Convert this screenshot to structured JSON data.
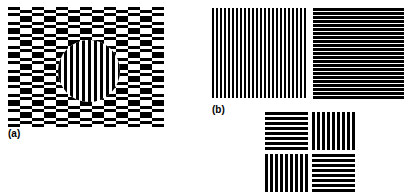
{
  "figure": {
    "background_color": "#ffffff",
    "foreground_color": "#000000",
    "width": 409,
    "height": 193
  },
  "panels": [
    {
      "id": "a",
      "label": "(a)",
      "name": "checkerboard-illusion-panel",
      "description": "Rectangular checkerboard of offset horizontal bar cells with a circular vertical-grating inset at the center",
      "x": 8,
      "y": 7,
      "width": 156,
      "height": 120,
      "pattern": {
        "type": "offset-bar-checkerboard",
        "columns": 13,
        "rows": 10,
        "cell_width": 12,
        "cell_height": 12,
        "bar_height": 3,
        "phase_offset": 3,
        "inset": {
          "type": "circle",
          "pattern": "vertical-grating",
          "center_x": 81,
          "center_y": 64,
          "radius": 31,
          "bar_width": 3
        }
      }
    },
    {
      "id": "b",
      "label": "(b)",
      "name": "paired-grating-panel",
      "description": "Two adjacent squares: left square vertical grating, right square dense horizontal grating",
      "x": 212,
      "y": 8,
      "width": 192,
      "height": 92,
      "squares": [
        {
          "name": "vertical-grating-square",
          "orientation": "vertical",
          "x": 212,
          "y": 8,
          "width": 95,
          "height": 90,
          "period": 4,
          "bar_width": 2,
          "duty_cycle": 0.5,
          "fill_appearance": "balanced black and white"
        },
        {
          "name": "horizontal-grating-square",
          "orientation": "horizontal",
          "x": 313,
          "y": 8,
          "width": 91,
          "height": 92,
          "period": 4,
          "bar_width": 3,
          "duty_cycle": 0.75,
          "fill_appearance": "predominantly black with thin white lines"
        }
      ]
    },
    {
      "id": "c",
      "label": "",
      "name": "quadrant-grating-panel",
      "description": "Two-by-two arrangement of square gratings with alternating orientation",
      "x": 265,
      "y": 112,
      "width": 90,
      "height": 81,
      "gap": 4,
      "quadrants": [
        {
          "name": "quadrant-top-left",
          "orientation": "horizontal",
          "period": 5,
          "bar_width": 3
        },
        {
          "name": "quadrant-top-right",
          "orientation": "vertical",
          "period": 5,
          "bar_width": 3
        },
        {
          "name": "quadrant-bottom-left",
          "orientation": "vertical",
          "period": 5,
          "bar_width": 3
        },
        {
          "name": "quadrant-bottom-right",
          "orientation": "horizontal",
          "period": 5,
          "bar_width": 3
        }
      ]
    }
  ]
}
